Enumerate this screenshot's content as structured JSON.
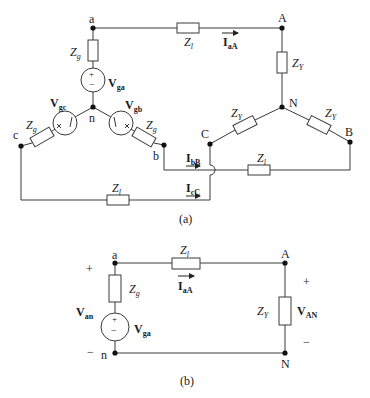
{
  "figure": {
    "part_a": {
      "caption": "(a)",
      "nodes": {
        "a": "a",
        "b": "b",
        "c": "c",
        "n": "n",
        "A": "A",
        "B": "B",
        "C": "C",
        "N": "N"
      },
      "sources": {
        "ga": {
          "main": "V",
          "sub": "ga",
          "top_sign": "+",
          "bottom_sign": "−"
        },
        "gb": {
          "main": "V",
          "sub": "gb"
        },
        "gc": {
          "main": "V",
          "sub": "gc"
        }
      },
      "impedances": {
        "zg_a": {
          "main": "Z",
          "sub": "g"
        },
        "zg_b": {
          "main": "Z",
          "sub": "g"
        },
        "zg_c": {
          "main": "Z",
          "sub": "g"
        },
        "zl_a": {
          "main": "Z",
          "sub": "l"
        },
        "zl_b": {
          "main": "Z",
          "sub": "l"
        },
        "zl_c": {
          "main": "Z",
          "sub": "l"
        },
        "zy_a": {
          "main": "Z",
          "sub": "Y"
        },
        "zy_b": {
          "main": "Z",
          "sub": "Y"
        },
        "zy_c": {
          "main": "Z",
          "sub": "Y"
        }
      },
      "currents": {
        "aA": {
          "main": "I",
          "sub": "aA"
        },
        "bB": {
          "main": "I",
          "sub": "bB"
        },
        "cC": {
          "main": "I",
          "sub": "cC"
        }
      }
    },
    "part_b": {
      "caption": "(b)",
      "nodes": {
        "a": "a",
        "n": "n",
        "A": "A",
        "N": "N"
      },
      "source": {
        "main": "V",
        "sub": "ga",
        "top_sign": "+",
        "bottom_sign": "−"
      },
      "zg": {
        "main": "Z",
        "sub": "g"
      },
      "zl": {
        "main": "Z",
        "sub": "l"
      },
      "zy": {
        "main": "Z",
        "sub": "Y"
      },
      "current": {
        "main": "I",
        "sub": "aA"
      },
      "van": {
        "main": "V",
        "sub": "an",
        "plus": "+",
        "minus": "−"
      },
      "vAN": {
        "main": "V",
        "sub": "AN",
        "plus": "+",
        "minus": "−"
      }
    },
    "colors": {
      "wire": "#3a3a3a",
      "node": "#111111",
      "text": "#1a1a1a"
    }
  }
}
